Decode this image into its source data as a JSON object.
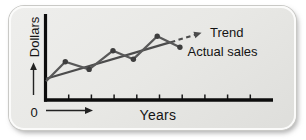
{
  "labels": {
    "origin": "0"
  },
  "colors": {
    "card_background": "#e8e8e5",
    "card_edge": "#fbfbfa",
    "axis": "#0d0d0d",
    "tick": "#1a1a1a",
    "trend_line": "#4c4c4c",
    "actual_line": "#595959",
    "marker": "#3e3e3e",
    "text": "#141414"
  },
  "chart_data": {
    "type": "line",
    "title": "",
    "xlabel": "Years",
    "ylabel": "Dollars",
    "origin_label": "0",
    "axis_numeric_labels": false,
    "x_axis_tick_count": 9,
    "x_range": [
      0,
      10
    ],
    "y_range": [
      0,
      10
    ],
    "grid": false,
    "legend_position": "inline labels at right end of each line",
    "series": [
      {
        "name": "Trend",
        "kind": "straight trend line, continues as dashed forecast arrow",
        "points": [
          [
            0,
            2.5
          ],
          [
            5.5,
            6.8
          ]
        ],
        "dashed_extension": [
          [
            5.5,
            6.8
          ],
          [
            6.6,
            7.7
          ]
        ]
      },
      {
        "name": "Actual sales",
        "kind": "zigzag line with dot markers oscillating around trend",
        "points": [
          [
            0,
            2.2
          ],
          [
            0.85,
            4.5
          ],
          [
            1.9,
            3.6
          ],
          [
            2.95,
            5.8
          ],
          [
            3.85,
            4.8
          ],
          [
            4.9,
            7.5
          ],
          [
            5.9,
            6.2
          ]
        ]
      }
    ]
  }
}
